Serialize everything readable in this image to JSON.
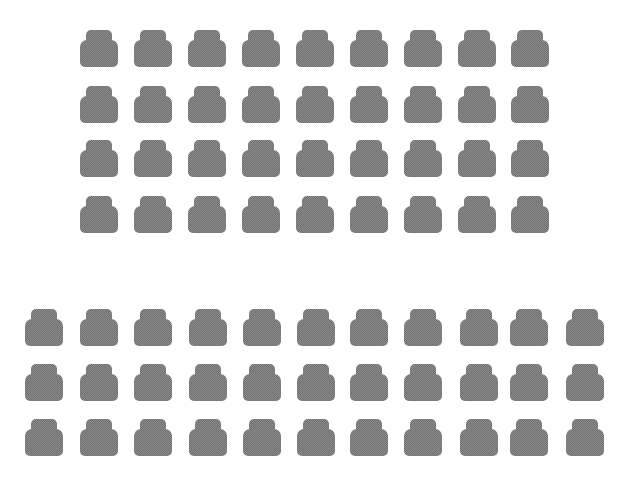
{
  "image": {
    "description": "Two grids of gray dithered car floor mat silhouettes on white background",
    "background": "#ffffff",
    "mat_color": "#8c8c8c"
  },
  "groups": [
    {
      "name": "top-group",
      "columns": 9,
      "rows": 4,
      "col_x": [
        80,
        134,
        188,
        242,
        296,
        350,
        404,
        458,
        511
      ],
      "row_y": [
        30,
        86,
        140,
        196
      ]
    },
    {
      "name": "bottom-group",
      "columns": 11,
      "rows": 3,
      "col_x": [
        25,
        80,
        134,
        189,
        243,
        297,
        350,
        404,
        460,
        510,
        566
      ],
      "row_y": [
        309,
        364,
        419
      ]
    }
  ]
}
